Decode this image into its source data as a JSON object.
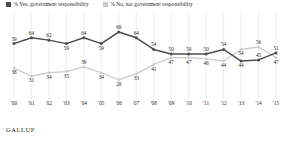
{
  "legend": {
    "items": [
      {
        "label": "% Yes, government responsibility",
        "color": "#4d4d4f",
        "icon": "square-swatch"
      },
      {
        "label": "% No, not government responsibility",
        "color": "#c7c8ca",
        "icon": "square-swatch"
      }
    ]
  },
  "source": {
    "label": "GALLUP"
  },
  "chart_data": {
    "type": "line",
    "title": "",
    "subtitle": "",
    "xlabel": "",
    "ylabel": "",
    "grid": "vertical",
    "legend_position": "top-left",
    "ylim": [
      20,
      75
    ],
    "xlim_categories": 16,
    "categories": [
      "'00",
      "'01",
      "'02",
      "'03",
      "'04",
      "'05",
      "'06",
      "'07",
      "'08",
      "'09",
      "'10",
      "'11",
      "'12",
      "'13",
      "'14",
      "'15"
    ],
    "series": [
      {
        "name": "% Yes, government responsibility",
        "color": "#4d4d4f",
        "values": [
          59,
          64,
          62,
          59,
          64,
          59,
          69,
          64,
          54,
          50,
          50,
          50,
          54,
          44,
          45,
          47
        ],
        "labels": [
          "59",
          "64",
          "62",
          "59",
          "64",
          "59",
          "69",
          "64",
          "54",
          "50",
          "50",
          "50",
          "54",
          "44",
          "45",
          "47"
        ]
      },
      {
        "name": "% No, not government responsibility",
        "color": "#c7c8ca",
        "values": [
          38,
          31,
          34,
          35,
          39,
          34,
          28,
          33,
          41,
          47,
          47,
          46,
          44,
          54,
          56,
          52
        ],
        "labels": [
          "38",
          "31",
          "34",
          "35",
          "39",
          "34",
          "28",
          "33",
          "41",
          "47",
          "47",
          "46",
          "44",
          "54",
          "56",
          "52"
        ]
      }
    ],
    "end_labels": {
      "yes_last": "51",
      "no_last": "47"
    }
  }
}
